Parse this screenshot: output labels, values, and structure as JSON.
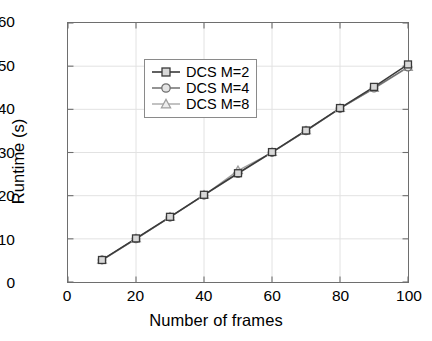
{
  "chart_data": {
    "type": "line",
    "title": "",
    "xlabel": "Number of frames",
    "ylabel": "Runtime (s)",
    "xlim": [
      0,
      100
    ],
    "ylim": [
      0,
      60
    ],
    "xticks": [
      0,
      20,
      40,
      60,
      80,
      100
    ],
    "yticks": [
      0,
      10,
      20,
      30,
      40,
      50,
      60
    ],
    "xticklabels": [
      "0",
      "20",
      "40",
      "60",
      "80",
      "100"
    ],
    "yticklabels": [
      "0",
      "10",
      "20",
      "30",
      "40",
      "50",
      "60"
    ],
    "grid": true,
    "legend_position": "upper left",
    "x": [
      10,
      20,
      30,
      40,
      50,
      60,
      70,
      80,
      90,
      100
    ],
    "series": [
      {
        "name": "DCS M=2",
        "marker": "square",
        "color": "#3a3a3a",
        "values": [
          5.1,
          10.1,
          15.1,
          20.2,
          25.2,
          30.1,
          35.1,
          40.3,
          45.2,
          50.4
        ]
      },
      {
        "name": "DCS M=4",
        "marker": "circle",
        "color": "#6f6f6f",
        "values": [
          5.1,
          10.0,
          15.0,
          20.1,
          25.1,
          30.0,
          35.0,
          40.2,
          44.9,
          49.8
        ]
      },
      {
        "name": "DCS M=8",
        "marker": "triangle",
        "color": "#9f9f9f",
        "values": [
          5.0,
          10.0,
          15.0,
          20.1,
          25.8,
          30.0,
          35.0,
          40.2,
          44.8,
          49.7
        ]
      }
    ]
  },
  "legend": {
    "entries": [
      {
        "label": "DCS M=2"
      },
      {
        "label": "DCS M=4"
      },
      {
        "label": "DCS M=8"
      }
    ]
  },
  "style": {
    "axis_color": "#6e6e6e",
    "grid_color": "#e2e2e2",
    "background": "#ffffff",
    "text_color": "#000000"
  }
}
